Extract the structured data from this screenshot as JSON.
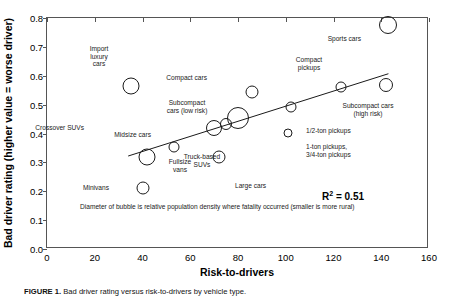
{
  "figure": {
    "caption_label": "FIGURE 1.",
    "caption_text": "Bad driver rating versus risk-to-drivers by vehicle type."
  },
  "chart_data": {
    "type": "scatter",
    "title": "",
    "xlabel": "Risk-to-drivers",
    "ylabel": "Bad driver rating (higher value = worse driver)",
    "xlim": [
      0,
      160
    ],
    "ylim": [
      0.0,
      0.8
    ],
    "xticks": [
      "0",
      "20",
      "40",
      "60",
      "80",
      "100",
      "120",
      "140",
      "160"
    ],
    "yticks": [
      "0.0",
      "0.1",
      "0.2",
      "0.3",
      "0.4",
      "0.5",
      "0.6",
      "0.7",
      "0.8"
    ],
    "grid": false,
    "legend": "none",
    "size_meaning": "Diameter of bubble is relative population density where fatality occurred (smaller is more rural)",
    "annotations": [
      {
        "name": "r-squared",
        "text": "R2 = 0.51",
        "base": "R",
        "exp": "2",
        "rest": " = 0.51"
      },
      {
        "name": "bubble-size-note",
        "text": "Diameter of bubble is relative population density where fatality occurred (smaller is more rural)"
      }
    ],
    "trendline": {
      "x0": 34,
      "y0": 0.322,
      "x1": 143,
      "y1": 0.607
    },
    "points": [
      {
        "label": "Import\nluxury\ncars",
        "x": 35,
        "y": 0.565,
        "r": 8.5
      },
      {
        "label": "Crossover SUVs",
        "x": 42,
        "y": 0.32,
        "r": 8.5
      },
      {
        "label": "Minivans",
        "x": 40,
        "y": 0.212,
        "r": 6.5
      },
      {
        "label": "Fullsize\nvans",
        "x": 53,
        "y": 0.353,
        "r": 5.5
      },
      {
        "label": "Midsize cars",
        "x": 70,
        "y": 0.418,
        "r": 8.0
      },
      {
        "label": "Large cars",
        "x": 72,
        "y": 0.318,
        "r": 6.5
      },
      {
        "label": "Subcompact\ncars (low risk)",
        "x": 75,
        "y": 0.432,
        "r": 6.0
      },
      {
        "label": "Truck-based\nSUVs",
        "x": 80,
        "y": 0.455,
        "r": 11.0
      },
      {
        "label": "Compact cars",
        "x": 86,
        "y": 0.545,
        "r": 6.5
      },
      {
        "label": "1/2-ton pickups",
        "x": 102,
        "y": 0.492,
        "r": 5.5
      },
      {
        "label": "1-ton pickups,\n3/4-ton pickups",
        "x": 101,
        "y": 0.402,
        "r": 4.5
      },
      {
        "label": "Compact\npickups",
        "x": 123,
        "y": 0.562,
        "r": 5.5
      },
      {
        "label": "Sports cars",
        "x": 143,
        "y": 0.775,
        "r": 9.0
      },
      {
        "label": "Subcompact cars\n(high risk)",
        "x": 142,
        "y": 0.568,
        "r": 7.0
      }
    ]
  }
}
